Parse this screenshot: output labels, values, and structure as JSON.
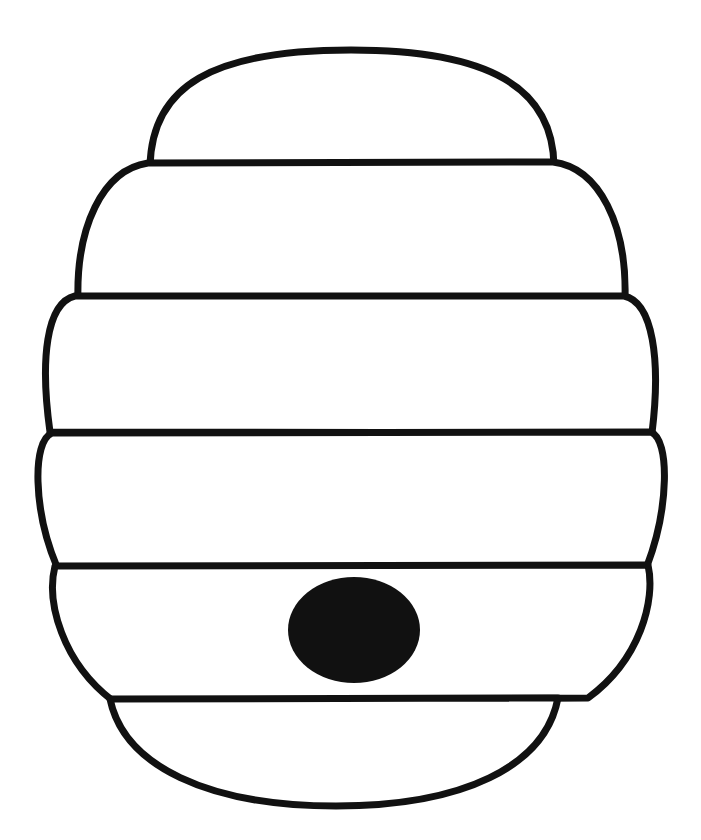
{
  "page": {
    "title": "Beehive Coloring Page Outline",
    "background_color": "#ffffff",
    "stroke_color": "#111111",
    "fill_color": "#ffffff",
    "stroke_width": 7,
    "width": 701,
    "height": 840
  },
  "drawing": {
    "subject": "beehive",
    "style": "black outline line art, white fill",
    "band_count": 6,
    "entrance": {
      "shape": "oval",
      "color": "#111111",
      "center_x": 354,
      "center_y": 630,
      "radius_x": 66,
      "radius_y": 53
    },
    "bands": [
      {
        "name": "band-1-dome-top",
        "label": "Top dome",
        "path": "M 150 166 C 152 86 212 50 351 50 C 490 50 553 88 554 166 Z"
      },
      {
        "name": "band-2",
        "label": "Second band",
        "path": "M 148 163 L 553 162 C 600 168 627 226 625 298 L 78 300 C 76 228 102 170 148 163 Z"
      },
      {
        "name": "band-3",
        "label": "Third band",
        "path": "M 75 296 L 624 296 C 653 302 661 360 652 433 L 50 432 C 40 360 46 303 75 296 Z"
      },
      {
        "name": "band-4",
        "label": "Fourth band",
        "path": "M 52 433 L 651 432 C 670 440 669 508 647 566 L 57 567 C 33 510 32 441 52 433 Z"
      },
      {
        "name": "band-5-entrance-band",
        "label": "Fifth band with entrance hole",
        "path": "M 55 566 L 648 565 C 656 600 640 660 588 698 L 113 701 C 62 662 46 602 55 566 Z"
      },
      {
        "name": "band-6-base",
        "label": "Bottom base band",
        "path": "M 110 699 L 558 698 C 545 767 462 806 336 806 C 208 806 124 766 110 699 Z"
      }
    ]
  }
}
